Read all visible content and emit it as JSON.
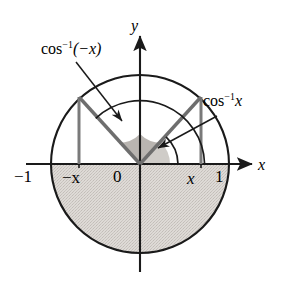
{
  "figure": {
    "colors": {
      "stroke": "#1a1a1a",
      "ray": "#6e6e6e",
      "shade_fill": "#d4d0cc",
      "sector_fill": "#b9b5b1",
      "background": "#ffffff"
    },
    "geometry": {
      "center_x": 140,
      "center_y": 164,
      "radius": 89,
      "x_value": 0.685,
      "point_right_x": 201,
      "point_left_x": 79,
      "point_top_y": 97
    },
    "labels": {
      "left_angle": "cos",
      "left_angle_sup": "−1",
      "left_angle_arg": "(−x)",
      "right_angle": "cos",
      "right_angle_sup": "−1",
      "right_angle_arg": "x",
      "axis_x": "x",
      "axis_y": "y",
      "tick_neg_one": "−1",
      "tick_neg_x": "−x",
      "tick_zero": "0",
      "tick_x": "x",
      "tick_one": "1"
    }
  }
}
